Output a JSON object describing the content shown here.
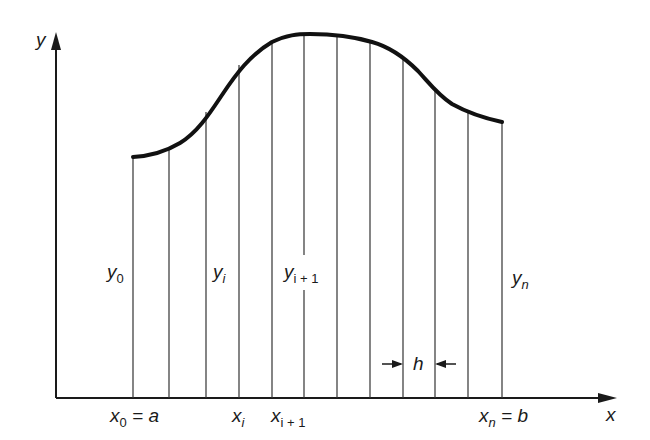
{
  "diagram": {
    "title": "",
    "colors": {
      "ink": "#1a1a1a",
      "background": "#ffffff"
    },
    "axes": {
      "x_label": "x",
      "y_label": "y"
    },
    "ordinate_labels": [
      {
        "base": "y",
        "sub": "0"
      },
      {
        "base": "y",
        "sub": "i"
      },
      {
        "base": "y",
        "sub": "i + 1"
      },
      {
        "base": "y",
        "sub": "n"
      }
    ],
    "abscissa_labels": [
      {
        "base": "x",
        "sub": "0",
        "suffix": " = a"
      },
      {
        "base": "x",
        "sub": "i",
        "suffix": ""
      },
      {
        "base": "x",
        "sub": "i + 1",
        "suffix": ""
      },
      {
        "base": "x",
        "sub": "n",
        "suffix": " = b"
      }
    ],
    "spacing_label": "h",
    "strip_x_positions": [
      133,
      169,
      206,
      239,
      272,
      304,
      337,
      370,
      403,
      435,
      468,
      502
    ],
    "curve_y_positions": [
      157,
      149,
      112,
      65,
      42,
      34,
      36,
      42,
      58,
      89,
      112,
      122
    ]
  }
}
